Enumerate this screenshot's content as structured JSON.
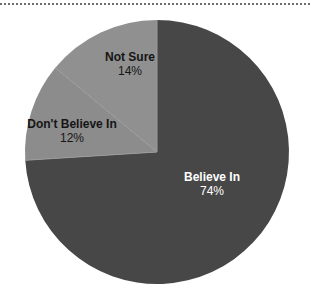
{
  "chart_data": {
    "type": "pie",
    "title": "",
    "subtitle": "",
    "xlabel": "",
    "ylabel": "",
    "legend_position": "none",
    "grid": false,
    "labels_inside": true,
    "categories": [
      "Believe In",
      "Don't Believe In",
      "Not Sure"
    ],
    "values": [
      74,
      12,
      14
    ],
    "value_unit": "%",
    "slices": [
      {
        "label": "Believe In",
        "percent": 74,
        "percent_text": "74%",
        "color": "#474747",
        "text_color": "#ffffff",
        "start_angle_deg": 0,
        "end_angle_deg": 266.4
      },
      {
        "label": "Don't Believe In",
        "percent": 12,
        "percent_text": "12%",
        "color": "#8c8c8c",
        "text_color": "#151515",
        "start_angle_deg": 266.4,
        "end_angle_deg": 309.6
      },
      {
        "label": "Not Sure",
        "percent": 14,
        "percent_text": "14%",
        "color": "#909090",
        "text_color": "#151515",
        "start_angle_deg": 309.6,
        "end_angle_deg": 360
      }
    ],
    "geometry": {
      "center_x": 157,
      "center_y": 152,
      "radius": 132
    },
    "divider_color": "#9a9a9a",
    "background_color": "#ffffff"
  },
  "decoration": {
    "top_rule_color": "#6d6d6d"
  }
}
